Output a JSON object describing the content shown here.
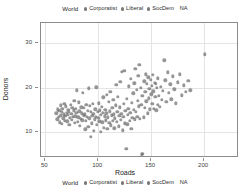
{
  "legend": {
    "title": "World",
    "items": [
      {
        "label": "Corporatist",
        "color": "#7a7a7a",
        "marker": "circle"
      },
      {
        "label": "Liberal",
        "color": "#7a7a7a",
        "marker": "circle"
      },
      {
        "label": "SocDem",
        "color": "#7a7a7a",
        "marker": "circle"
      },
      {
        "label": "NA",
        "color": "#7a7a7a",
        "marker": "none"
      }
    ],
    "position_top": "top-center",
    "position_bottom": "bottom-center"
  },
  "chart_data": {
    "type": "scatter",
    "title": "",
    "xlabel": "Roads",
    "ylabel": "Donors",
    "xlim": [
      46,
      233
    ],
    "ylim": [
      4.2,
      34.5
    ],
    "xticks": [
      50,
      100,
      150,
      200
    ],
    "yticks": [
      10,
      20,
      30
    ],
    "grid": true,
    "point_color": "#6e6e6e",
    "point_opacity": 0.72,
    "legend_title": "World",
    "legend_entries": [
      "Corporatist",
      "Liberal",
      "SocDem",
      "NA"
    ],
    "series": [
      {
        "name": "World",
        "points": [
          [
            60.5,
            14.2
          ],
          [
            61.3,
            12.9
          ],
          [
            62.1,
            15.1
          ],
          [
            62.8,
            13.4
          ],
          [
            63.4,
            14.8
          ],
          [
            63.9,
            12.2
          ],
          [
            64.5,
            16.0
          ],
          [
            64.9,
            13.8
          ],
          [
            65.4,
            14.5
          ],
          [
            65.8,
            11.9
          ],
          [
            66.3,
            15.3
          ],
          [
            66.9,
            13.1
          ],
          [
            67.4,
            14.0
          ],
          [
            67.9,
            16.4
          ],
          [
            68.5,
            12.6
          ],
          [
            69.0,
            13.7
          ],
          [
            69.6,
            15.8
          ],
          [
            70.1,
            14.3
          ],
          [
            70.7,
            12.4
          ],
          [
            71.2,
            13.9
          ],
          [
            71.8,
            15.0
          ],
          [
            72.3,
            14.6
          ],
          [
            72.9,
            11.6
          ],
          [
            73.4,
            13.2
          ],
          [
            74.0,
            16.2
          ],
          [
            74.6,
            14.1
          ],
          [
            75.1,
            12.8
          ],
          [
            75.7,
            15.5
          ],
          [
            76.2,
            13.5
          ],
          [
            76.8,
            14.9
          ],
          [
            77.3,
            17.0
          ],
          [
            77.9,
            12.1
          ],
          [
            78.4,
            13.6
          ],
          [
            79.0,
            15.2
          ],
          [
            79.5,
            14.4
          ],
          [
            80.1,
            19.4
          ],
          [
            80.6,
            12.3
          ],
          [
            81.2,
            13.3
          ],
          [
            81.7,
            16.7
          ],
          [
            82.3,
            14.7
          ],
          [
            82.8,
            11.4
          ],
          [
            83.4,
            13.0
          ],
          [
            84.0,
            15.6
          ],
          [
            84.5,
            14.2
          ],
          [
            85.1,
            12.7
          ],
          [
            85.6,
            18.9
          ],
          [
            86.2,
            13.8
          ],
          [
            86.7,
            15.4
          ],
          [
            87.3,
            14.0
          ],
          [
            87.8,
            10.6
          ],
          [
            88.4,
            12.5
          ],
          [
            88.9,
            16.1
          ],
          [
            89.5,
            13.4
          ],
          [
            90.0,
            14.8
          ],
          [
            90.6,
            11.2
          ],
          [
            91.1,
            19.8
          ],
          [
            91.7,
            13.1
          ],
          [
            92.2,
            15.9
          ],
          [
            92.8,
            14.5
          ],
          [
            93.3,
            9.0
          ],
          [
            93.9,
            12.0
          ],
          [
            94.4,
            13.7
          ],
          [
            95.0,
            16.3
          ],
          [
            95.5,
            14.1
          ],
          [
            96.1,
            10.3
          ],
          [
            96.6,
            12.9
          ],
          [
            97.2,
            15.1
          ],
          [
            97.7,
            13.5
          ],
          [
            98.3,
            20.1
          ],
          [
            98.8,
            11.7
          ],
          [
            99.4,
            14.6
          ],
          [
            100.0,
            13.2
          ],
          [
            100.5,
            16.5
          ],
          [
            101.1,
            12.4
          ],
          [
            101.6,
            14.9
          ],
          [
            102.2,
            10.1
          ],
          [
            102.7,
            13.9
          ],
          [
            103.3,
            15.7
          ],
          [
            103.8,
            12.2
          ],
          [
            104.4,
            14.3
          ],
          [
            104.9,
            17.8
          ],
          [
            105.5,
            11.0
          ],
          [
            106.0,
            13.6
          ],
          [
            106.6,
            15.0
          ],
          [
            107.1,
            12.7
          ],
          [
            107.7,
            14.2
          ],
          [
            108.2,
            18.4
          ],
          [
            108.8,
            10.8
          ],
          [
            109.3,
            13.3
          ],
          [
            109.9,
            16.8
          ],
          [
            110.4,
            12.1
          ],
          [
            111.0,
            14.7
          ],
          [
            111.5,
            19.1
          ],
          [
            112.1,
            11.5
          ],
          [
            112.6,
            13.8
          ],
          [
            113.2,
            15.4
          ],
          [
            113.7,
            12.6
          ],
          [
            114.3,
            17.2
          ],
          [
            114.8,
            14.0
          ],
          [
            115.4,
            10.9
          ],
          [
            115.9,
            13.1
          ],
          [
            116.5,
            16.0
          ],
          [
            117.0,
            20.6
          ],
          [
            117.6,
            12.3
          ],
          [
            118.1,
            14.5
          ],
          [
            118.7,
            18.0
          ],
          [
            119.2,
            11.3
          ],
          [
            119.8,
            13.7
          ],
          [
            120.3,
            15.6
          ],
          [
            120.9,
            21.3
          ],
          [
            121.4,
            12.8
          ],
          [
            122.0,
            14.1
          ],
          [
            122.5,
            23.6
          ],
          [
            123.1,
            10.4
          ],
          [
            123.6,
            13.4
          ],
          [
            124.2,
            16.3
          ],
          [
            124.7,
            23.8
          ],
          [
            125.3,
            12.0
          ],
          [
            125.8,
            14.8
          ],
          [
            126.4,
            6.2
          ],
          [
            126.9,
            17.5
          ],
          [
            127.5,
            11.8
          ],
          [
            128.0,
            13.9
          ],
          [
            128.6,
            15.2
          ],
          [
            129.1,
            20.3
          ],
          [
            129.7,
            12.5
          ],
          [
            130.2,
            14.4
          ],
          [
            130.8,
            22.0
          ],
          [
            131.3,
            10.7
          ],
          [
            131.9,
            16.6
          ],
          [
            132.4,
            13.2
          ],
          [
            133.0,
            18.7
          ],
          [
            133.5,
            15.0
          ],
          [
            134.1,
            21.0
          ],
          [
            134.6,
            12.9
          ],
          [
            135.2,
            24.2
          ],
          [
            135.7,
            14.6
          ],
          [
            136.3,
            19.5
          ],
          [
            136.8,
            13.5
          ],
          [
            137.4,
            17.1
          ],
          [
            137.9,
            22.6
          ],
          [
            138.5,
            15.8
          ],
          [
            139.0,
            25.1
          ],
          [
            139.6,
            13.0
          ],
          [
            140.1,
            20.0
          ],
          [
            140.7,
            16.2
          ],
          [
            141.2,
            5.0
          ],
          [
            141.8,
            18.2
          ],
          [
            142.3,
            5.1
          ],
          [
            142.9,
            13.3
          ],
          [
            143.4,
            21.4
          ],
          [
            144.0,
            15.5
          ],
          [
            144.5,
            19.0
          ],
          [
            145.1,
            23.0
          ],
          [
            145.6,
            16.9
          ],
          [
            146.2,
            20.8
          ],
          [
            146.7,
            14.2
          ],
          [
            147.3,
            22.3
          ],
          [
            147.8,
            17.6
          ],
          [
            148.4,
            19.7
          ],
          [
            148.9,
            15.1
          ],
          [
            149.5,
            21.8
          ],
          [
            150.0,
            18.5
          ],
          [
            150.6,
            20.4
          ],
          [
            151.1,
            16.4
          ],
          [
            151.7,
            22.9
          ],
          [
            152.2,
            19.2
          ],
          [
            152.8,
            15.3
          ],
          [
            153.3,
            21.1
          ],
          [
            153.9,
            17.9
          ],
          [
            154.4,
            20.9
          ],
          [
            155.0,
            14.9
          ],
          [
            155.5,
            19.9
          ],
          [
            156.1,
            16.1
          ],
          [
            156.6,
            22.1
          ],
          [
            157.2,
            18.1
          ],
          [
            158.0,
            15.7
          ],
          [
            159.0,
            20.2
          ],
          [
            160.0,
            17.3
          ],
          [
            161.0,
            19.3
          ],
          [
            162.5,
            26.1
          ],
          [
            163.5,
            21.6
          ],
          [
            164.5,
            16.8
          ],
          [
            165.5,
            23.4
          ],
          [
            166.5,
            18.8
          ],
          [
            168.0,
            20.7
          ],
          [
            169.0,
            17.4
          ],
          [
            170.5,
            22.5
          ],
          [
            172.0,
            19.6
          ],
          [
            173.5,
            16.5
          ],
          [
            175.0,
            21.2
          ],
          [
            177.0,
            23.0
          ],
          [
            179.0,
            18.3
          ],
          [
            181.0,
            20.5
          ],
          [
            183.0,
            19.1
          ],
          [
            185.0,
            21.5
          ],
          [
            187.0,
            19.4
          ],
          [
            200.5,
            27.5
          ]
        ]
      }
    ]
  },
  "axes": {
    "x": {
      "label": "Roads",
      "ticks": [
        "50",
        "100",
        "150",
        "200"
      ]
    },
    "y": {
      "label": "Donors",
      "ticks": [
        "30",
        "20",
        "10"
      ]
    }
  }
}
